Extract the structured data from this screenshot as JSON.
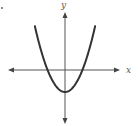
{
  "chart_data": {
    "type": "line",
    "title": "",
    "subtitle": "",
    "xlabel": "x",
    "ylabel": "y",
    "grid": false,
    "legend": null,
    "ticks": false,
    "function_description": "Upward-opening parabola with vertex on the negative y-axis, crossing the x-axis at two symmetric points",
    "function_form": "y = x^2 - c (c > 0)",
    "series": [
      {
        "name": "parabola",
        "x": [
          -3,
          -2.5,
          -2,
          -1.5,
          -1,
          -0.5,
          0,
          0.5,
          1,
          1.5,
          2,
          2.5,
          3
        ],
        "values": [
          5.25,
          2.5,
          0.25,
          -1.5,
          -2.75,
          -3.5,
          -3.75,
          -3.5,
          -2.75,
          -1.5,
          0.25,
          2.5,
          5.25
        ]
      }
    ],
    "xlim": [
      -4,
      4
    ],
    "ylim": [
      -5,
      7
    ],
    "annotations": []
  },
  "axes": {
    "x_label": "x",
    "y_label": "y"
  },
  "colors": {
    "curve": "#333333",
    "axes": "#555555",
    "background": "#ffffff"
  }
}
